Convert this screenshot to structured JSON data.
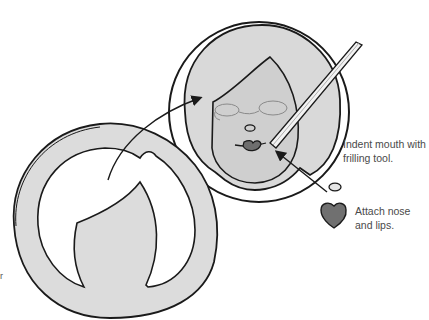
{
  "diagram": {
    "type": "craft-instruction-illustration",
    "steps": [
      {
        "id": "indent-mouth",
        "text": "Indent mouth with frilling tool."
      },
      {
        "id": "attach-features",
        "text": "Attach nose and lips."
      }
    ],
    "labels": {
      "mouth_line1": "Indent mouth with",
      "mouth_line2": "frilling tool.",
      "nose_line1": "Attach nose",
      "nose_line2": "and lips."
    },
    "edge_mark": "r",
    "elements": [
      "hair-cutout-ring (left, large)",
      "face-disc (right, with hair, face, glasses outline, nose, lips)",
      "frilling-tool",
      "nose-piece",
      "lips-piece",
      "arrow hair-to-face",
      "arrow pieces-to-face"
    ],
    "colors": {
      "outline": "#1a1a1a",
      "paste_light": "#dcdcdc",
      "face": "#d2d2d2",
      "lips": "#6e6e6e",
      "background": "#ffffff",
      "text": "#4a4a4a"
    }
  }
}
